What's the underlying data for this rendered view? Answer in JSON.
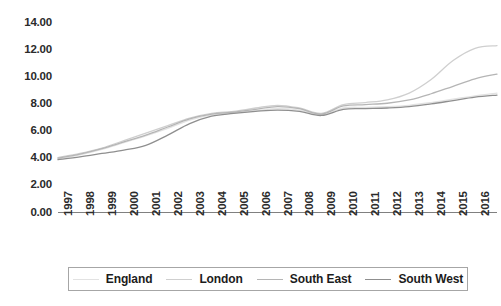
{
  "chart_data": {
    "type": "line",
    "title": "",
    "xlabel": "",
    "ylabel": "",
    "grid": false,
    "legend_position": "bottom",
    "xlim": [
      1997,
      2017
    ],
    "ylim": [
      0.0,
      14.0
    ],
    "y_ticks": [
      "0.00",
      "2.00",
      "4.00",
      "6.00",
      "8.00",
      "10.00",
      "12.00",
      "14.00"
    ],
    "y_tick_values": [
      0,
      2,
      4,
      6,
      8,
      10,
      12,
      14
    ],
    "categories": [
      "1997",
      "1998",
      "1999",
      "2000",
      "2001",
      "2002",
      "2003",
      "2004",
      "2005",
      "2006",
      "2007",
      "2008",
      "2009",
      "2010",
      "2011",
      "2012",
      "2013",
      "2014",
      "2015",
      "2016",
      "2017"
    ],
    "series": [
      {
        "name": "England",
        "color": "#e2e2e2",
        "values": [
          3.95,
          4.25,
          4.65,
          5.15,
          5.65,
          6.2,
          6.8,
          7.2,
          7.35,
          7.5,
          7.65,
          7.55,
          7.2,
          7.7,
          7.75,
          7.8,
          7.9,
          8.1,
          8.35,
          8.6,
          8.8
        ]
      },
      {
        "name": "London",
        "color": "#cfcfcf",
        "values": [
          4.05,
          4.35,
          4.75,
          5.3,
          5.85,
          6.4,
          6.95,
          7.3,
          7.45,
          7.7,
          7.9,
          7.7,
          7.3,
          7.95,
          8.1,
          8.3,
          8.8,
          9.8,
          11.2,
          12.1,
          12.3
        ]
      },
      {
        "name": "South East",
        "color": "#b5b5b5",
        "values": [
          4.0,
          4.3,
          4.7,
          5.2,
          5.7,
          6.3,
          6.9,
          7.25,
          7.4,
          7.6,
          7.8,
          7.65,
          7.25,
          7.85,
          7.95,
          8.05,
          8.3,
          8.75,
          9.3,
          9.85,
          10.2
        ]
      },
      {
        "name": "South West",
        "color": "#8f8f8f",
        "values": [
          3.9,
          4.1,
          4.35,
          4.6,
          4.95,
          5.7,
          6.55,
          7.1,
          7.3,
          7.45,
          7.55,
          7.45,
          7.15,
          7.6,
          7.65,
          7.7,
          7.8,
          8.0,
          8.25,
          8.5,
          8.65
        ]
      }
    ],
    "legend_entries": [
      "England",
      "London",
      "South East",
      "South West"
    ]
  },
  "axis": {
    "axis_line_color": "#808080"
  }
}
